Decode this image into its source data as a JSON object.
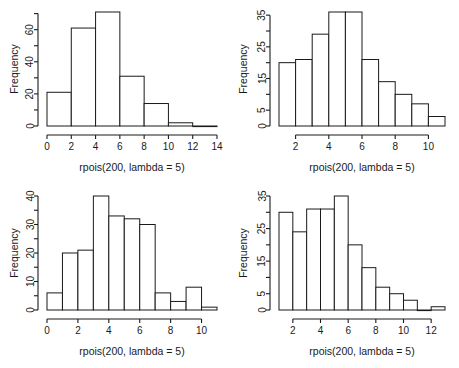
{
  "figure": {
    "type": "multi-panel-histogram-figure",
    "rows": 2,
    "cols": 2,
    "background": "#ffffff",
    "foreground": "#1a1a1a"
  },
  "chart_data": [
    {
      "id": "top-left",
      "type": "bar",
      "title": "",
      "subtitle": "",
      "xlabel": "rpois(200, lambda = 5)",
      "ylabel": "Frequency",
      "bin_width": 2,
      "bin_edges": [
        0,
        2,
        4,
        6,
        8,
        10,
        12,
        14
      ],
      "categories": [
        "0-2",
        "2-4",
        "4-6",
        "6-8",
        "8-10",
        "10-12",
        "12-14"
      ],
      "values": [
        21,
        61,
        71,
        31,
        14,
        2,
        0
      ],
      "xlim": [
        0,
        14
      ],
      "ylim": [
        0,
        71
      ],
      "xticks": [
        0,
        2,
        4,
        6,
        8,
        10,
        12,
        14
      ],
      "xticklabels": [
        "0",
        "2",
        "4",
        "6",
        "8",
        "10",
        "12",
        "14"
      ],
      "yticks": [
        0,
        20,
        40,
        60
      ],
      "yticklabels": [
        "0",
        "20",
        "40",
        "60"
      ],
      "y_minor_ticks": [
        10,
        30,
        50,
        70
      ],
      "grid": false,
      "legend": null
    },
    {
      "id": "top-right",
      "type": "bar",
      "title": "",
      "subtitle": "",
      "xlabel": "rpois(200, lambda = 5)",
      "ylabel": "Frequency",
      "bin_width": 1,
      "bin_edges": [
        1,
        2,
        3,
        4,
        5,
        6,
        7,
        8,
        9,
        10,
        11
      ],
      "categories": [
        "1-2",
        "2-3",
        "3-4",
        "4-5",
        "5-6",
        "6-7",
        "7-8",
        "8-9",
        "9-10",
        "10-11"
      ],
      "values": [
        20,
        21,
        29,
        36,
        36,
        21,
        14,
        10,
        7,
        3
      ],
      "xlim": [
        1,
        11
      ],
      "ylim": [
        0,
        36
      ],
      "xticks": [
        2,
        4,
        6,
        8,
        10
      ],
      "xticklabels": [
        "2",
        "4",
        "6",
        "8",
        "10"
      ],
      "yticks": [
        0,
        5,
        15,
        25,
        35
      ],
      "yticklabels": [
        "0",
        "5",
        "15",
        "25",
        "35"
      ],
      "y_minor_ticks": [
        10,
        20,
        30
      ],
      "grid": false,
      "legend": null
    },
    {
      "id": "bottom-left",
      "type": "bar",
      "title": "",
      "subtitle": "",
      "xlabel": "rpois(200, lambda = 5)",
      "ylabel": "Frequency",
      "bin_width": 1,
      "bin_edges": [
        0,
        1,
        2,
        3,
        4,
        5,
        6,
        7,
        8,
        9,
        10,
        11
      ],
      "categories": [
        "0-1",
        "1-2",
        "2-3",
        "3-4",
        "4-5",
        "5-6",
        "6-7",
        "7-8",
        "8-9",
        "9-10",
        "10-11"
      ],
      "values": [
        6,
        20,
        21,
        40,
        33,
        32,
        30,
        6,
        3,
        8,
        1
      ],
      "xlim": [
        0,
        11
      ],
      "ylim": [
        0,
        40
      ],
      "xticks": [
        0,
        2,
        4,
        6,
        8,
        10
      ],
      "xticklabels": [
        "0",
        "2",
        "4",
        "6",
        "8",
        "10"
      ],
      "yticks": [
        0,
        10,
        20,
        30,
        40
      ],
      "yticklabels": [
        "0",
        "10",
        "20",
        "30",
        "40"
      ],
      "y_minor_ticks": [
        5,
        15,
        25,
        35
      ],
      "grid": false,
      "legend": null
    },
    {
      "id": "bottom-right",
      "type": "bar",
      "title": "",
      "subtitle": "",
      "xlabel": "rpois(200, lambda = 5)",
      "ylabel": "Frequency",
      "bin_width": 1,
      "bin_edges": [
        1,
        2,
        3,
        4,
        5,
        6,
        7,
        8,
        9,
        10,
        11,
        12,
        13
      ],
      "categories": [
        "1-2",
        "2-3",
        "3-4",
        "4-5",
        "5-6",
        "6-7",
        "7-8",
        "8-9",
        "9-10",
        "10-11",
        "11-12",
        "12-13"
      ],
      "values": [
        30,
        24,
        31,
        31,
        35,
        20,
        13,
        7,
        5,
        3,
        0,
        1
      ],
      "xlim": [
        1,
        13
      ],
      "ylim": [
        0,
        35
      ],
      "xticks": [
        2,
        4,
        6,
        8,
        10,
        12
      ],
      "xticklabels": [
        "2",
        "4",
        "6",
        "8",
        "10",
        "12"
      ],
      "yticks": [
        0,
        5,
        15,
        25,
        35
      ],
      "yticklabels": [
        "0",
        "5",
        "15",
        "25",
        "35"
      ],
      "y_minor_ticks": [
        10,
        20,
        30
      ],
      "grid": false,
      "legend": null
    }
  ]
}
